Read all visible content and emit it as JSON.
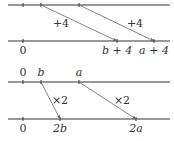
{
  "colors": {
    "line": "#333333",
    "arrow": "#666666",
    "text": "#333333"
  },
  "diagrams": [
    {
      "name": "addition",
      "top_line": {
        "y": 5,
        "x1": 8,
        "x2": 170,
        "ticks": [
          23,
          41,
          79
        ]
      },
      "bottom_line": {
        "y": 41,
        "x1": 8,
        "x2": 170,
        "ticks": [
          23,
          117,
          154
        ]
      },
      "arrows": [
        {
          "x1": 41,
          "y1": 5,
          "x2": 117,
          "y2": 41,
          "label": "+4",
          "lx": 61,
          "ly": 18
        },
        {
          "x1": 79,
          "y1": 5,
          "x2": 154,
          "y2": 41,
          "label": "+4",
          "lx": 135,
          "ly": 18
        }
      ],
      "top_labels": [],
      "bottom_labels": [
        {
          "text": "0",
          "x": 23,
          "y": 45,
          "italic": false
        },
        {
          "text": "b + 4",
          "x": 117,
          "y": 45,
          "italic": true
        },
        {
          "text": "a + 4",
          "x": 154,
          "y": 45,
          "italic": true
        }
      ]
    },
    {
      "name": "multiplication",
      "top_line": {
        "y": 82,
        "x1": 8,
        "x2": 170,
        "ticks": [
          23,
          41,
          79
        ]
      },
      "bottom_line": {
        "y": 119,
        "x1": 8,
        "x2": 170,
        "ticks": [
          23,
          60,
          136
        ]
      },
      "arrows": [
        {
          "x1": 41,
          "y1": 82,
          "x2": 60,
          "y2": 119,
          "label": "×2",
          "lx": 60,
          "ly": 95
        },
        {
          "x1": 79,
          "y1": 82,
          "x2": 136,
          "y2": 119,
          "label": "×2",
          "lx": 122,
          "ly": 95
        }
      ],
      "top_labels": [
        {
          "text": "0",
          "x": 23,
          "y": 67,
          "italic": false
        },
        {
          "text": "b",
          "x": 41,
          "y": 67,
          "italic": true
        },
        {
          "text": "a",
          "x": 79,
          "y": 67,
          "italic": true
        }
      ],
      "bottom_labels": [
        {
          "text": "0",
          "x": 23,
          "y": 123,
          "italic": false
        },
        {
          "text": "2b",
          "x": 60,
          "y": 123,
          "italic": true
        },
        {
          "text": "2a",
          "x": 136,
          "y": 123,
          "italic": true
        }
      ]
    }
  ]
}
